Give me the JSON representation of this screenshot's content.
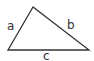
{
  "diagram": {
    "type": "triangle",
    "stroke_color": "#333333",
    "background": "#ffffff",
    "vertices": {
      "top": [
        33,
        7
      ],
      "bottom_left": [
        8,
        50
      ],
      "bottom_right": [
        89,
        50
      ]
    },
    "sides": [
      {
        "id": "a",
        "label": "a",
        "between": [
          "bottom_left",
          "top"
        ]
      },
      {
        "id": "b",
        "label": "b",
        "between": [
          "top",
          "bottom_right"
        ]
      },
      {
        "id": "c",
        "label": "c",
        "between": [
          "bottom_left",
          "bottom_right"
        ]
      }
    ]
  }
}
